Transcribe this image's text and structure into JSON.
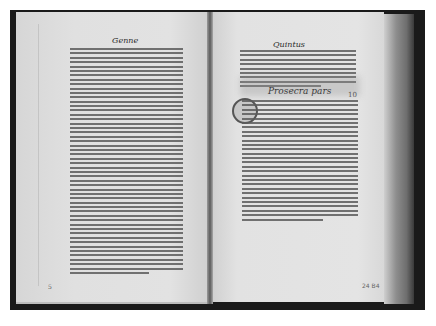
{
  "photo": {
    "subject": "open early printed book (incunabulum), grayscale photograph",
    "colors": {
      "background": "#ffffff",
      "binding": "#1a1a1a",
      "paper": "#e0e0e0",
      "ink": "#2a2a2a"
    }
  },
  "left_page": {
    "running_head": "Genne",
    "body_lines": 52,
    "signature_mark": "5"
  },
  "right_page": {
    "running_head": "Quintus",
    "intro_lines": 9,
    "section_heading": "Prosecra pars",
    "folio_number": "10",
    "body_lines": 28,
    "pencil_note": "24  B4"
  }
}
